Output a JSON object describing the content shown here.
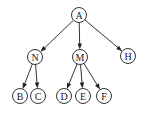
{
  "diagram": {
    "type": "tree",
    "nodes": [
      {
        "id": "A",
        "label": "A",
        "x": 79,
        "y": 15
      },
      {
        "id": "N",
        "label": "N",
        "x": 35,
        "y": 57
      },
      {
        "id": "M",
        "label": "M",
        "x": 80,
        "y": 57
      },
      {
        "id": "H",
        "label": "H",
        "x": 128,
        "y": 56
      },
      {
        "id": "B",
        "label": "B",
        "x": 20,
        "y": 96
      },
      {
        "id": "C",
        "label": "C",
        "x": 38,
        "y": 96
      },
      {
        "id": "D",
        "label": "D",
        "x": 64,
        "y": 96
      },
      {
        "id": "E",
        "label": "E",
        "x": 83,
        "y": 96
      },
      {
        "id": "F",
        "label": "F",
        "x": 104,
        "y": 96
      }
    ],
    "edges": [
      {
        "from": "A",
        "to": "N"
      },
      {
        "from": "A",
        "to": "M"
      },
      {
        "from": "A",
        "to": "H"
      },
      {
        "from": "N",
        "to": "B"
      },
      {
        "from": "N",
        "to": "C"
      },
      {
        "from": "M",
        "to": "D"
      },
      {
        "from": "M",
        "to": "E"
      },
      {
        "from": "M",
        "to": "F"
      }
    ],
    "node_radius": 7.5,
    "colors": {
      "stroke": "#333333",
      "text": "#222222",
      "background": "#ffffff"
    }
  }
}
